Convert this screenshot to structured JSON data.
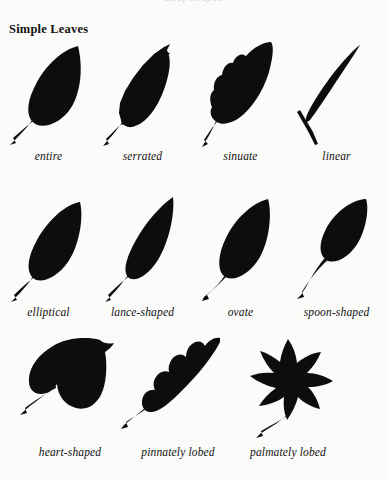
{
  "page": {
    "background_color": "#fbfbf9",
    "ink_color": "#0d0d0d",
    "running_head_faint": "Leaf Shapes",
    "title": "Simple Leaves"
  },
  "rows": [
    {
      "items": [
        {
          "label": "entire",
          "icon": "leaf-entire-silhouette"
        },
        {
          "label": "serrated",
          "icon": "leaf-serrated-silhouette"
        },
        {
          "label": "sinuate",
          "icon": "leaf-sinuate-silhouette"
        },
        {
          "label": "linear",
          "icon": "leaf-linear-silhouette"
        }
      ]
    },
    {
      "items": [
        {
          "label": "elliptical",
          "icon": "leaf-elliptical-silhouette"
        },
        {
          "label": "lance-shaped",
          "icon": "leaf-lance-shaped-silhouette"
        },
        {
          "label": "ovate",
          "icon": "leaf-ovate-silhouette"
        },
        {
          "label": "spoon-shaped",
          "icon": "leaf-spoon-shaped-silhouette"
        }
      ]
    },
    {
      "items": [
        {
          "label": "heart-shaped",
          "icon": "leaf-heart-shaped-silhouette"
        },
        {
          "label": "pinnately lobed",
          "icon": "leaf-pinnately-lobed-silhouette"
        },
        {
          "label": "palmately lobed",
          "icon": "leaf-palmately-lobed-silhouette"
        }
      ]
    }
  ]
}
